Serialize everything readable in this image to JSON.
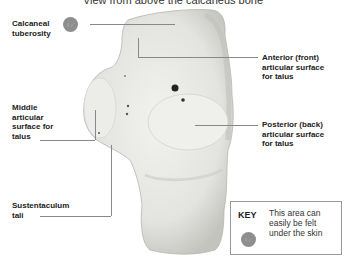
{
  "title": "View from above the calcaneus bone",
  "labels": {
    "calcaneal_tuberosity": [
      "Calcaneal",
      "tuberosity"
    ],
    "anterior_surface": [
      "Anterior (front)",
      "articular surface",
      "for talus"
    ],
    "middle_surface": [
      "Middle",
      "articular",
      "surface for",
      "talus"
    ],
    "posterior_surface": [
      "Posterior (back)",
      "articular surface",
      "for talus"
    ],
    "sustentaculum": [
      "Sustentaculum",
      "tali"
    ]
  },
  "key": {
    "title": "KEY",
    "lines": [
      "This area can",
      "easily be felt",
      "under the skin"
    ],
    "icon": "palpable-hand-icon"
  },
  "colors": {
    "bone": "#e9e9e6",
    "bone_shadow": "#c9c9c5",
    "leader_line": "#888888",
    "icon": "#8e8e8e"
  }
}
